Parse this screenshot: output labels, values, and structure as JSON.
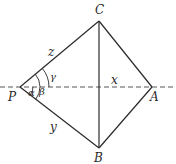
{
  "diagram": {
    "points": {
      "C": {
        "label": "C",
        "x": 99,
        "y": 21
      },
      "P": {
        "label": "P",
        "x": 20,
        "y": 87
      },
      "A": {
        "label": "A",
        "x": 152,
        "y": 87
      },
      "B": {
        "label": "B",
        "x": 99,
        "y": 148
      }
    },
    "segments": {
      "z": {
        "label": "z",
        "from": "P",
        "to": "C"
      },
      "y": {
        "label": "y",
        "from": "P",
        "to": "B"
      },
      "x": {
        "label": "x",
        "from": "P",
        "to": "A",
        "style": "dashed"
      }
    },
    "angles": {
      "alpha": {
        "label": "α"
      },
      "beta": {
        "label": "β"
      },
      "gamma": {
        "label": "γ"
      }
    },
    "colors": {
      "line": "#2a2a2a",
      "dashed": "#555555",
      "background": "#ffffff"
    }
  }
}
